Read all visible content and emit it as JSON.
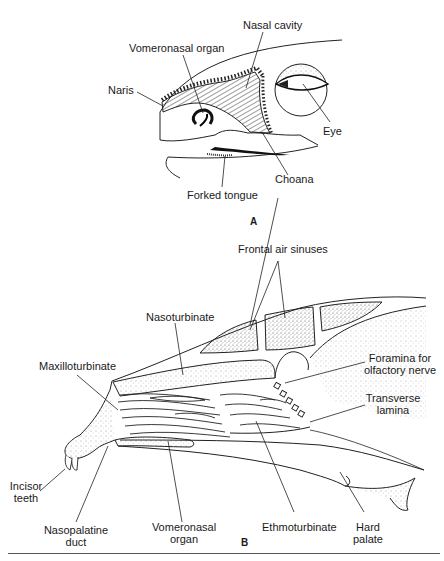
{
  "figure": {
    "panel_a": {
      "letter": "A",
      "labels": {
        "nasal_cavity": "Nasal cavity",
        "vomeronasal_organ": "Vomeronasal organ",
        "naris": "Naris",
        "eye": "Eye",
        "choana": "Choana",
        "forked_tongue": "Forked tongue"
      }
    },
    "panel_b": {
      "letter": "B",
      "labels": {
        "frontal_air_sinuses": "Frontal air sinuses",
        "nasoturbinate": "Nasoturbinate",
        "maxilloturbinate": "Maxilloturbinate",
        "foramina_line1": "Foramina for",
        "foramina_line2": "olfactory nerve",
        "transverse_line1": "Transverse",
        "transverse_line2": "lamina",
        "incisor_line1": "Incisor",
        "incisor_line2": "teeth",
        "nasopalatine_line1": "Nasopalatine",
        "nasopalatine_line2": "duct",
        "vomeronasal_line1": "Vomeronasal",
        "vomeronasal_line2": "organ",
        "ethmoturbinate": "Ethmoturbinate",
        "hard_palate_line1": "Hard",
        "hard_palate_line2": "palate"
      }
    }
  }
}
